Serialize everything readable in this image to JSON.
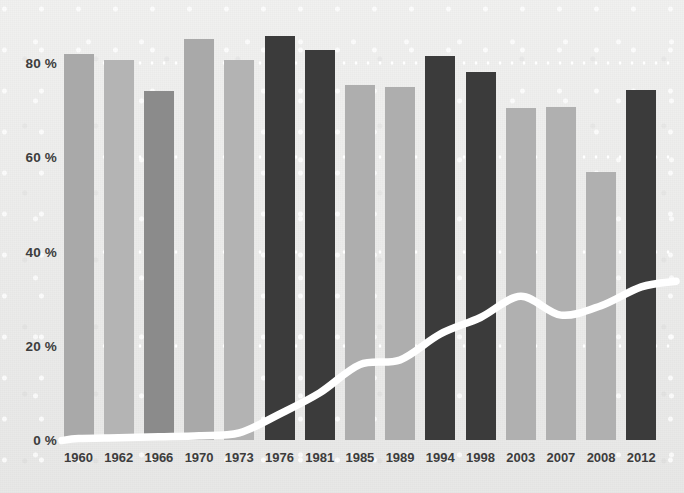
{
  "chart": {
    "axes": {
      "y_unit_suffix": "%",
      "x_label": "",
      "y_label": ""
    }
  },
  "chart_data": {
    "type": "bar",
    "title": "",
    "subtitle": "",
    "xlabel": "",
    "ylabel": "",
    "ylim": [
      0,
      90
    ],
    "ytick_labels": [
      "0 %",
      "20 %",
      "40 %",
      "60 %",
      "80 %"
    ],
    "ytick_values": [
      0,
      20,
      40,
      60,
      80
    ],
    "grid": true,
    "grid_style": "dotted-white-horizontal",
    "legend": "none",
    "categories": [
      "1960",
      "1962",
      "1966",
      "1970",
      "1973",
      "1976",
      "1981",
      "1985",
      "1989",
      "1994",
      "1998",
      "2003",
      "2007",
      "2008",
      "2012"
    ],
    "series": [
      {
        "name": "bars",
        "type": "bar",
        "values": [
          82.0,
          80.6,
          74.0,
          85.0,
          80.6,
          85.8,
          82.7,
          75.3,
          74.9,
          81.4,
          78.0,
          70.4,
          70.6,
          56.8,
          74.2
        ],
        "bar_colors": [
          "#a9a9a9",
          "#b4b4b4",
          "#8b8b8b",
          "#a9a9a9",
          "#b3b3b3",
          "#3b3b3b",
          "#3b3b3b",
          "#aeaeae",
          "#aeaeae",
          "#3b3b3b",
          "#3b3b3b",
          "#b0b0b0",
          "#b0b0b0",
          "#b0b0b0",
          "#3b3b3b"
        ]
      },
      {
        "name": "line",
        "type": "line",
        "color": "#ffffff",
        "values": [
          0.3,
          0.5,
          0.7,
          0.9,
          1.5,
          5.5,
          10.0,
          16.0,
          17.0,
          22.5,
          26.0,
          30.5,
          26.5,
          28.5,
          32.5
        ]
      }
    ],
    "colors": {
      "background": "#efefef",
      "bar_light": "#b0b0b0",
      "bar_medium": "#8b8b8b",
      "bar_dark": "#3b3b3b",
      "line": "#ffffff",
      "text": "#3d3d3d",
      "gridline": "#ffffff"
    }
  }
}
